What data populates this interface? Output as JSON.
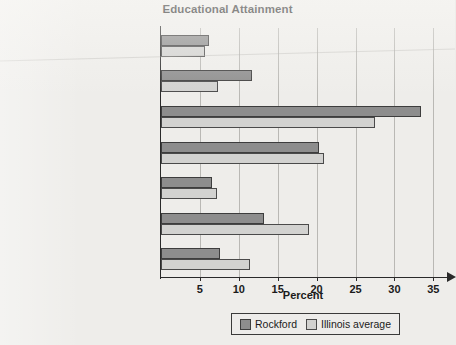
{
  "chart_data": {
    "type": "bar",
    "orientation": "horizontal",
    "title": "Educational Attainment",
    "xlabel": "Percent",
    "ylabel": "",
    "xlim": [
      0,
      36.5
    ],
    "xticks": [
      5,
      10,
      15,
      20,
      25,
      30,
      35
    ],
    "xtick_labels": [
      "5",
      "10",
      "15",
      "20",
      "25",
      "30",
      "35"
    ],
    "grid": "vertical",
    "legend_position": "bottom",
    "categories": [
      "Less than 9th grade",
      "9th to 12th grade, no diploma",
      "High school graduate\n(includes equivalency)",
      "Some college, no degree",
      "Associate's degree",
      "Bachelor's degree",
      "Graduate or professional degree"
    ],
    "category_lines": [
      [
        "Less than 9th grade"
      ],
      [
        "9th to 12th grade, no diploma"
      ],
      [
        "High school graduate",
        "(includes equivalency)"
      ],
      [
        "Some college, no degree"
      ],
      [
        "Associate's degree"
      ],
      [
        "Bachelor's degree"
      ],
      [
        "Graduate or professional degree"
      ]
    ],
    "series": [
      {
        "name": "Rockford",
        "color": "#8d8d8d",
        "values": [
          6.2,
          11.7,
          33.4,
          20.3,
          6.6,
          13.2,
          7.6
        ]
      },
      {
        "name": "Illinois average",
        "color": "#d2d2d0",
        "values": [
          5.7,
          7.3,
          27.5,
          21.0,
          7.2,
          19.0,
          11.5
        ]
      }
    ]
  },
  "legend": {
    "entries": [
      {
        "label": "Rockford",
        "swatch": "dark-gray-swatch"
      },
      {
        "label": "Illinois average",
        "swatch": "light-gray-swatch"
      }
    ]
  },
  "colors": {
    "background": "#eeedea",
    "axis": "#2a2a2a",
    "gridline": "#b9b8b4",
    "series_rockford": "#8d8d8d",
    "series_illinois": "#d2d2d0",
    "text": "#1b1b1b"
  }
}
